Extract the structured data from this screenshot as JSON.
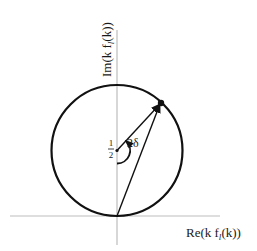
{
  "diagram": {
    "type": "argand-unitarity-circle",
    "axes": {
      "horizontal_label": "Re(k f",
      "horizontal_sub": "l",
      "horizontal_tail": "(k))",
      "vertical_label": "Im(k f",
      "vertical_sub": "l",
      "vertical_tail": "(k))"
    },
    "circle": {
      "center_label_num": "1",
      "center_label_den": "2",
      "center_imag": 0.5,
      "radius": 0.5
    },
    "angle": {
      "label": "2δ"
    },
    "colors": {
      "axis": "#bdbdbd",
      "stroke": "#111111"
    }
  }
}
